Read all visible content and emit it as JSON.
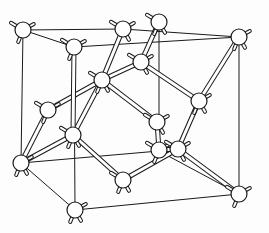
{
  "figure": {
    "title": "Diamond cubic crystal structure",
    "colors": {
      "line": "#1a1a1a",
      "atom_fill": "#ffffff",
      "background": "#fdfdfd"
    }
  },
  "cube_edges": [
    [
      23,
      30,
      123,
      29
    ],
    [
      23,
      30,
      74,
      47
    ],
    [
      123,
      29,
      239,
      37
    ],
    [
      74,
      47,
      239,
      37
    ],
    [
      23,
      30,
      21,
      163
    ],
    [
      74,
      47,
      75,
      210
    ],
    [
      159,
      22,
      159,
      151
    ],
    [
      239,
      37,
      239,
      194
    ],
    [
      21,
      163,
      159,
      151
    ],
    [
      21,
      163,
      75,
      210
    ],
    [
      75,
      210,
      239,
      194
    ],
    [
      159,
      151,
      239,
      194
    ]
  ],
  "atoms": [
    {
      "id": "a1",
      "x": 23,
      "y": 30
    },
    {
      "id": "a2",
      "x": 123,
      "y": 29
    },
    {
      "id": "a3",
      "x": 159,
      "y": 22
    },
    {
      "id": "a4",
      "x": 239,
      "y": 37
    },
    {
      "id": "a5",
      "x": 74,
      "y": 47
    },
    {
      "id": "a6",
      "x": 141,
      "y": 62
    },
    {
      "id": "a7",
      "x": 102,
      "y": 80
    },
    {
      "id": "a8",
      "x": 199,
      "y": 101
    },
    {
      "id": "a9",
      "x": 48,
      "y": 110
    },
    {
      "id": "a10",
      "x": 157,
      "y": 122
    },
    {
      "id": "a11",
      "x": 73,
      "y": 135
    },
    {
      "id": "a12",
      "x": 21,
      "y": 163
    },
    {
      "id": "a13",
      "x": 159,
      "y": 150
    },
    {
      "id": "a14",
      "x": 178,
      "y": 149
    },
    {
      "id": "a15",
      "x": 123,
      "y": 180
    },
    {
      "id": "a16",
      "x": 75,
      "y": 210
    },
    {
      "id": "a17",
      "x": 239,
      "y": 194
    }
  ],
  "bonds": [
    [
      "a7",
      "a2"
    ],
    [
      "a7",
      "a6"
    ],
    [
      "a7",
      "a9"
    ],
    [
      "a7",
      "a11"
    ],
    [
      "a7",
      "a10"
    ],
    [
      "a6",
      "a3"
    ],
    [
      "a6",
      "a8"
    ],
    [
      "a8",
      "a4"
    ],
    [
      "a8",
      "a14"
    ],
    [
      "a11",
      "a12"
    ],
    [
      "a11",
      "a5"
    ],
    [
      "a11",
      "a15"
    ],
    [
      "a9",
      "a12"
    ],
    [
      "a14",
      "a17"
    ],
    [
      "a14",
      "a15"
    ],
    [
      "a14",
      "a13"
    ],
    [
      "a10",
      "a13"
    ]
  ]
}
